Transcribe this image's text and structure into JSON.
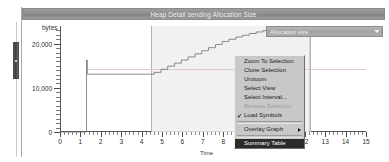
{
  "window": {
    "title": "Heap Detail sending Allocation Size"
  },
  "toolbar": {
    "combo_value": "Allocation size",
    "combo_arrow_icon": "chevron-down-icon"
  },
  "chart_data": {
    "type": "line",
    "title": "Heap Detail sending Allocation Size",
    "xlabel": "Time",
    "ylabel": "bytes",
    "xlim": [
      0,
      15
    ],
    "ylim": [
      0,
      24000
    ],
    "grid": false,
    "legend": "none",
    "ytick_labels": [
      "0",
      "10,000",
      "20,000"
    ],
    "ytick_values": [
      0,
      10000,
      20000
    ],
    "xtick_labels": [
      "0",
      "1",
      "2",
      "3",
      "4",
      "5",
      "6",
      "7",
      "8",
      "9",
      "10",
      "11",
      "12",
      "13",
      "14",
      "15"
    ],
    "xtick_values": [
      0,
      1,
      2,
      3,
      4,
      5,
      6,
      7,
      8,
      9,
      10,
      11,
      12,
      13,
      14,
      15
    ],
    "selection": {
      "x_start": 4.45,
      "x_end": 12.25,
      "label": "selected interval"
    },
    "series": [
      {
        "name": "Allocation size",
        "style": "step",
        "x": [
          0.0,
          1.28,
          1.3,
          1.34,
          1.36,
          4.45,
          4.62,
          4.95,
          5.28,
          5.62,
          5.95,
          6.28,
          6.62,
          6.95,
          7.28,
          7.62,
          7.95,
          8.28,
          8.62,
          8.95,
          9.28,
          9.62,
          9.95,
          10.28,
          10.62,
          10.95,
          11.3,
          12.25,
          15.0
        ],
        "y": [
          0,
          0,
          16300,
          13100,
          13100,
          13100,
          13500,
          14200,
          14900,
          15600,
          16300,
          17000,
          17700,
          18400,
          19100,
          19800,
          20500,
          21000,
          21500,
          21900,
          22300,
          22650,
          22950,
          23150,
          23300,
          23400,
          23450,
          23450,
          23450
        ]
      }
    ],
    "guide_line_y": 14200,
    "marker_point": {
      "x": 11.85,
      "y": 400
    }
  },
  "context_menu": {
    "items": [
      {
        "label": "Zoom To Selection",
        "state": "enabled",
        "checked": false,
        "submenu": false
      },
      {
        "label": "Clone Selection",
        "state": "enabled",
        "checked": false,
        "submenu": false
      },
      {
        "label": "Unzoom",
        "state": "enabled",
        "checked": false,
        "submenu": false
      },
      {
        "label": "Select View",
        "state": "enabled",
        "checked": false,
        "submenu": false
      },
      {
        "label": "Select Interval...",
        "state": "enabled",
        "checked": false,
        "submenu": false
      },
      {
        "label": "Restore Selection",
        "state": "disabled",
        "checked": false,
        "submenu": false
      },
      {
        "label": "Load Symbols",
        "state": "enabled",
        "checked": true,
        "submenu": false
      },
      {
        "label": "Overlay Graph",
        "state": "enabled",
        "checked": false,
        "submenu": true
      },
      {
        "label": "Summary Table",
        "state": "selected",
        "checked": false,
        "submenu": false
      }
    ],
    "check_glyph": "✔",
    "submenu_arrow_icon": "chevron-right-icon"
  },
  "scrollbar": {
    "name": "vertical-scrollbar"
  },
  "colors": {
    "titlebar": "#919191",
    "selection_band": "#efefef",
    "menu_bg": "#c8c8c8",
    "menu_selected_bg": "#2b2b2b",
    "series_stroke": "#707070"
  }
}
